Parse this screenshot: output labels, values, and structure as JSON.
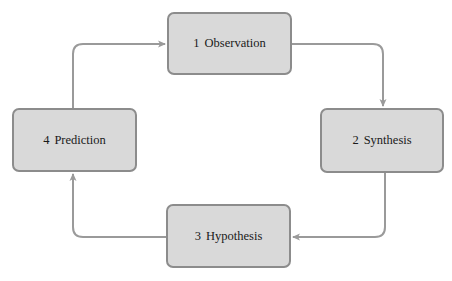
{
  "diagram": {
    "type": "cycle",
    "colors": {
      "node_fill": "#d9d9d9",
      "node_border": "#8c8c8c",
      "arrow": "#9a9a9a",
      "text": "#1a1a1a"
    },
    "nodes": [
      {
        "id": 1,
        "number": "1",
        "label": "Observation",
        "x": 167,
        "y": 12,
        "w": 125,
        "h": 63
      },
      {
        "id": 2,
        "number": "2",
        "label": "Synthesis",
        "x": 320,
        "y": 108,
        "w": 124,
        "h": 65
      },
      {
        "id": 3,
        "number": "3",
        "label": "Hypothesis",
        "x": 166,
        "y": 204,
        "w": 125,
        "h": 64
      },
      {
        "id": 4,
        "number": "4",
        "label": "Prediction",
        "x": 12,
        "y": 108,
        "w": 125,
        "h": 64
      }
    ],
    "edges": [
      {
        "from": 1,
        "to": 2
      },
      {
        "from": 2,
        "to": 3
      },
      {
        "from": 3,
        "to": 4
      },
      {
        "from": 4,
        "to": 1
      }
    ]
  }
}
